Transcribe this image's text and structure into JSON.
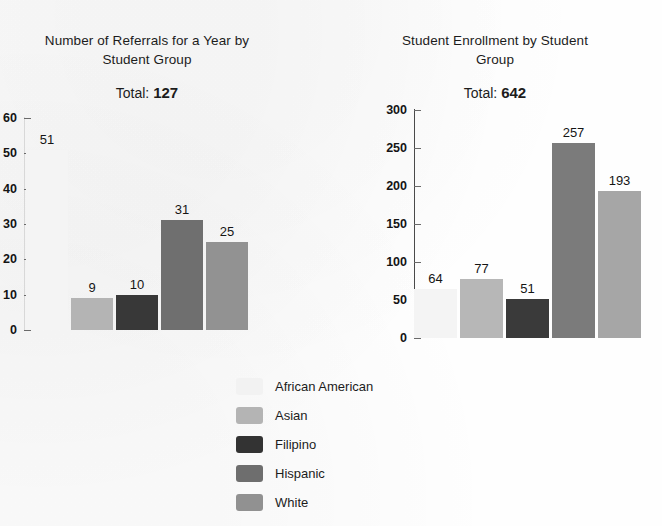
{
  "chart_data": [
    {
      "type": "bar",
      "id": "referrals",
      "title": "Number of Referrals for a Year by Student Group",
      "title_lines": [
        "Number of Referrals for a Year by",
        "Student Group"
      ],
      "total_label": "Total:",
      "total_value": "127",
      "categories": [
        "African American",
        "Asian",
        "Filipino",
        "Hispanic",
        "White"
      ],
      "values": [
        51,
        9,
        10,
        31,
        25
      ],
      "value_labels": [
        "51",
        "9",
        "10",
        "31",
        "25"
      ],
      "colors": [
        "#f4f4f4",
        "#b4b4b4",
        "#383838",
        "#6f6f6f",
        "#929292"
      ],
      "xlabel": "",
      "ylabel": "",
      "ylim": [
        0,
        60
      ],
      "ytick_step": 10,
      "yticks": [
        0,
        10,
        20,
        30,
        40,
        50,
        60
      ],
      "ytick_labels": [
        "0",
        "10",
        "20",
        "30",
        "40",
        "50",
        "60"
      ],
      "grid": false,
      "legend_position": "bottom-center",
      "note": "left edge of this chart is cropped by the page boundary"
    },
    {
      "type": "bar",
      "id": "enrollment",
      "title": "Student Enrollment by Student Group",
      "title_lines": [
        "Student Enrollment by Student",
        "Group"
      ],
      "total_label": "Total:",
      "total_value": "642",
      "categories": [
        "African American",
        "Asian",
        "Filipino",
        "Hispanic",
        "White"
      ],
      "values": [
        64,
        77,
        51,
        257,
        193
      ],
      "value_labels": [
        "64",
        "77",
        "51",
        "257",
        "193"
      ],
      "colors": [
        "#f4f4f4",
        "#b7b7b7",
        "#3a3a3a",
        "#7b7b7b",
        "#a6a6a6"
      ],
      "xlabel": "",
      "ylabel": "",
      "ylim": [
        0,
        300
      ],
      "ytick_step": 50,
      "yticks": [
        0,
        50,
        100,
        150,
        200,
        250,
        300
      ],
      "ytick_labels": [
        "0",
        "50",
        "100",
        "150",
        "200",
        "250",
        "300"
      ],
      "grid": false,
      "legend_position": "bottom-center"
    }
  ],
  "legend": {
    "items": [
      {
        "label": "African American",
        "color": "#f2f2f2"
      },
      {
        "label": "Asian",
        "color": "#b4b4b4"
      },
      {
        "label": "Filipino",
        "color": "#333333"
      },
      {
        "label": "Hispanic",
        "color": "#6e6e6e"
      },
      {
        "label": "White",
        "color": "#919191"
      }
    ]
  }
}
